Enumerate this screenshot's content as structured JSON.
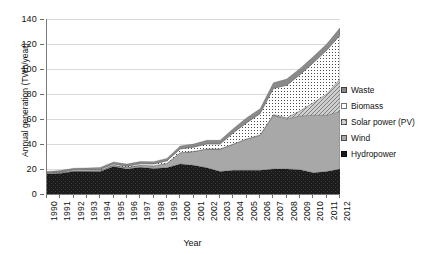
{
  "chart_data": {
    "type": "area",
    "stacked": true,
    "title": "",
    "xlabel": "Year",
    "ylabel": "Annual generation (TWh/year)",
    "ylim": [
      0,
      140
    ],
    "ytick_step": 20,
    "yticks": [
      0,
      20,
      40,
      60,
      80,
      100,
      120,
      140
    ],
    "grid": true,
    "legend_position": "right",
    "categories": [
      "1990",
      "1991",
      "1992",
      "1993",
      "1994",
      "1995",
      "1996",
      "1997",
      "1998",
      "1999",
      "2000",
      "2001",
      "2002",
      "2003",
      "2004",
      "2005",
      "2006",
      "2007",
      "2008",
      "2009",
      "2010",
      "2011",
      "2012"
    ],
    "series": [
      {
        "name": "Hydropower",
        "fill": "#1c1c1c",
        "pattern": "solid-dark",
        "values": [
          16,
          16.5,
          18,
          18,
          18,
          22,
          20,
          21.5,
          20.5,
          21,
          24,
          23,
          21,
          18,
          19,
          19,
          19,
          20,
          20,
          19.5,
          17,
          18,
          20
        ]
      },
      {
        "name": "Wind",
        "fill": "#a8a8a8",
        "pattern": "solid-gray",
        "values": [
          0.3,
          0.4,
          0.5,
          0.6,
          0.8,
          1,
          1.2,
          1.5,
          2,
          3.5,
          9,
          11,
          15,
          18,
          21,
          25,
          28,
          43,
          40,
          43,
          46,
          45,
          46
        ]
      },
      {
        "name": "Solar power (PV)",
        "fill": "#c4c4c4",
        "pattern": "cross-hatch",
        "values": [
          0,
          0,
          0,
          0,
          0,
          0,
          0,
          0,
          0,
          0,
          0,
          0,
          0,
          0,
          0,
          0.1,
          0.3,
          0.5,
          1,
          4,
          10,
          17,
          26
        ]
      },
      {
        "name": "Biomass",
        "fill": "#ffffff",
        "pattern": "dotted",
        "values": [
          0.5,
          0.6,
          0.7,
          0.8,
          0.9,
          1,
          1,
          1.2,
          1.5,
          2,
          3,
          3.5,
          4,
          4,
          9,
          13,
          17,
          21,
          26,
          29,
          32,
          35,
          35
        ]
      },
      {
        "name": "Waste",
        "fill": "#8a8a8a",
        "pattern": "solid-midgray",
        "values": [
          1.2,
          1.3,
          1.4,
          1.5,
          1.6,
          1.7,
          1.8,
          1.8,
          1.9,
          2,
          2.5,
          2.5,
          3,
          3,
          3.5,
          4,
          4,
          4.5,
          5,
          5,
          5,
          5,
          6
        ]
      }
    ],
    "totals": [
      18,
      18.8,
      20.6,
      20.9,
      21.3,
      25.7,
      24,
      26,
      25.9,
      28.5,
      38.5,
      40,
      43,
      43,
      52.5,
      61.1,
      68.3,
      89,
      92,
      100.5,
      110,
      120,
      133
    ]
  },
  "legend": {
    "items": [
      {
        "label": "Waste",
        "swatch": "waste-swatch"
      },
      {
        "label": "Biomass",
        "swatch": "biomass-swatch"
      },
      {
        "label": "Solar power (PV)",
        "swatch": "solar-swatch"
      },
      {
        "label": "Wind",
        "swatch": "wind-swatch"
      },
      {
        "label": "Hydropower",
        "swatch": "hydropower-swatch"
      }
    ]
  },
  "colors": {
    "hydropower": "#1c1c1c",
    "wind": "#a8a8a8",
    "solar": "#c4c4c4",
    "biomass": "#ffffff",
    "waste": "#8a8a8a",
    "grid": "#d9d9d9",
    "axis": "#7a7a7a",
    "text": "#111111",
    "background": "#ffffff"
  }
}
